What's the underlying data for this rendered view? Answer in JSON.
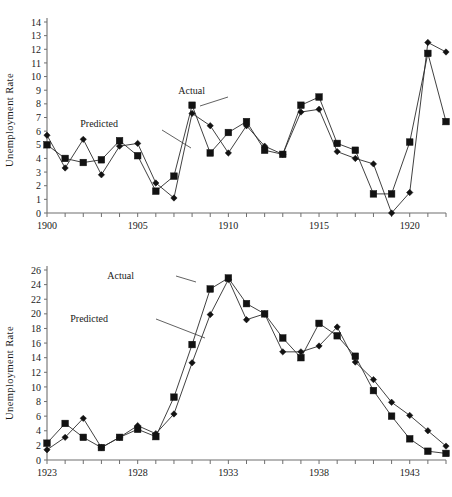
{
  "figure": {
    "ylabel": "Unemployment Rate",
    "series_labels": {
      "actual": "Actual",
      "predicted": "Predicted"
    }
  },
  "chart_data": [
    {
      "type": "line",
      "id": "top-panel",
      "title": "",
      "xlabel": "",
      "ylabel": "Unemployment Rate",
      "xlim": [
        1900,
        1922
      ],
      "ylim": [
        0,
        14
      ],
      "ytick_step": 1,
      "yticks": [
        0,
        1,
        2,
        3,
        4,
        5,
        6,
        7,
        8,
        9,
        10,
        11,
        12,
        13,
        14
      ],
      "xticks_labeled": [
        1900,
        1905,
        1910,
        1915,
        1920
      ],
      "xtick_step": 1,
      "grid": false,
      "legend": "annotations-with-leader-lines",
      "x": [
        1900,
        1901,
        1902,
        1903,
        1904,
        1905,
        1906,
        1907,
        1908,
        1909,
        1910,
        1911,
        1912,
        1913,
        1914,
        1915,
        1916,
        1917,
        1918,
        1919,
        1920,
        1921,
        1922
      ],
      "series": [
        {
          "name": "Actual",
          "marker": "square",
          "values": [
            5.0,
            4.0,
            3.7,
            3.9,
            5.3,
            4.2,
            1.6,
            2.7,
            7.9,
            4.4,
            5.9,
            6.7,
            4.6,
            4.3,
            7.9,
            8.5,
            5.1,
            4.6,
            1.4,
            1.4,
            5.2,
            11.7,
            6.7
          ]
        },
        {
          "name": "Predicted",
          "marker": "diamond",
          "values": [
            5.7,
            3.3,
            5.4,
            2.8,
            4.9,
            5.1,
            2.2,
            1.1,
            7.3,
            6.4,
            4.4,
            6.4,
            4.9,
            4.3,
            7.4,
            7.6,
            4.5,
            4.0,
            3.6,
            0.0,
            1.5,
            12.5,
            11.8
          ]
        }
      ]
    },
    {
      "type": "line",
      "id": "bottom-panel",
      "title": "",
      "xlabel": "",
      "ylabel": "Unemployment Rate",
      "xlim": [
        1923,
        1945
      ],
      "ylim": [
        0,
        26
      ],
      "ytick_step": 2,
      "yticks": [
        0,
        2,
        4,
        6,
        8,
        10,
        12,
        14,
        16,
        18,
        20,
        22,
        24,
        26
      ],
      "xticks_labeled": [
        1923,
        1928,
        1933,
        1938,
        1943
      ],
      "xtick_step": 1,
      "grid": false,
      "legend": "annotations-with-leader-lines",
      "x": [
        1923,
        1924,
        1925,
        1926,
        1927,
        1928,
        1929,
        1930,
        1931,
        1932,
        1933,
        1934,
        1935,
        1936,
        1937,
        1938,
        1939,
        1940,
        1941,
        1942,
        1943,
        1944,
        1945
      ],
      "series": [
        {
          "name": "Actual",
          "marker": "square",
          "values": [
            2.3,
            5.0,
            3.1,
            1.7,
            3.1,
            4.2,
            3.2,
            8.6,
            15.8,
            23.4,
            24.9,
            21.4,
            20.0,
            16.7,
            14.0,
            18.7,
            17.0,
            14.2,
            9.5,
            6.0,
            2.9,
            1.2,
            0.9
          ]
        },
        {
          "name": "Predicted",
          "marker": "diamond",
          "values": [
            1.4,
            3.1,
            5.7,
            1.7,
            3.1,
            4.7,
            3.6,
            6.3,
            13.3,
            19.9,
            24.7,
            19.2,
            20.0,
            14.8,
            14.8,
            15.6,
            18.2,
            13.4,
            11.0,
            7.9,
            6.1,
            4.0,
            1.9
          ]
        }
      ]
    }
  ]
}
